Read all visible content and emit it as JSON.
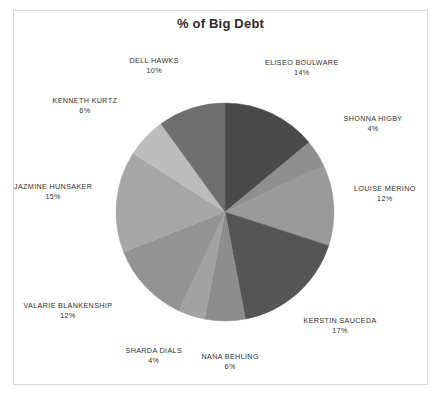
{
  "chart_data": {
    "type": "pie",
    "title": "% of Big Debt",
    "xlabel": "",
    "ylabel": "",
    "legend_position": "none",
    "grid": false,
    "value_suffix": "%",
    "start_angle_deg": 0,
    "direction": "clockwise",
    "categories": [
      "ELISEO BOULWARE",
      "SHONNA HIGBY",
      "LOUISE MERINO",
      "KERSTIN SAUCEDA",
      "NANA BEHLING",
      "SHARDA DIALS",
      "VALARIE BLANKENSHIP",
      "JAZMINE HUNSAKER",
      "KENNETH KURTZ",
      "DELL HAWKS"
    ],
    "values": [
      14,
      4,
      12,
      17,
      6,
      4,
      12,
      15,
      6,
      10
    ],
    "colors": [
      "#4a4a4a",
      "#8f8f8f",
      "#9a9a9a",
      "#555555",
      "#8d8d8d",
      "#a2a2a2",
      "#939393",
      "#a6a6a6",
      "#bcbcbc",
      "#6f6f6f"
    ],
    "slices": [
      {
        "label": "ELISEO BOULWARE",
        "value": 14,
        "display_value": "14%",
        "color": "#4a4a4a"
      },
      {
        "label": "SHONNA HIGBY",
        "value": 4,
        "display_value": "4%",
        "color": "#8f8f8f"
      },
      {
        "label": "LOUISE MERINO",
        "value": 12,
        "display_value": "12%",
        "color": "#9a9a9a"
      },
      {
        "label": "KERSTIN SAUCEDA",
        "value": 17,
        "display_value": "17%",
        "color": "#555555"
      },
      {
        "label": "NANA BEHLING",
        "value": 6,
        "display_value": "6%",
        "color": "#8d8d8d"
      },
      {
        "label": "SHARDA DIALS",
        "value": 4,
        "display_value": "4%",
        "color": "#a2a2a2"
      },
      {
        "label": "VALARIE BLANKENSHIP",
        "value": 12,
        "display_value": "12%",
        "color": "#939393"
      },
      {
        "label": "JAZMINE HUNSAKER",
        "value": 15,
        "display_value": "15%",
        "color": "#a6a6a6"
      },
      {
        "label": "KENNETH KURTZ",
        "value": 6,
        "display_value": "6%",
        "color": "#bcbcbc"
      },
      {
        "label": "DELL HAWKS",
        "value": 10,
        "display_value": "10%",
        "color": "#6f6f6f"
      }
    ]
  },
  "label_positions": [
    {
      "left": 262,
      "top": 58,
      "align": "center"
    },
    {
      "left": 333,
      "top": 114,
      "align": "center"
    },
    {
      "left": 345,
      "top": 184,
      "align": "center"
    },
    {
      "left": 300,
      "top": 316,
      "align": "center"
    },
    {
      "left": 190,
      "top": 352,
      "align": "center"
    },
    {
      "left": 114,
      "top": 346,
      "align": "center"
    },
    {
      "left": 28,
      "top": 301,
      "align": "center"
    },
    {
      "left": 13,
      "top": 182,
      "align": "center"
    },
    {
      "left": 45,
      "top": 96,
      "align": "center"
    },
    {
      "left": 114,
      "top": 56,
      "align": "center"
    }
  ]
}
